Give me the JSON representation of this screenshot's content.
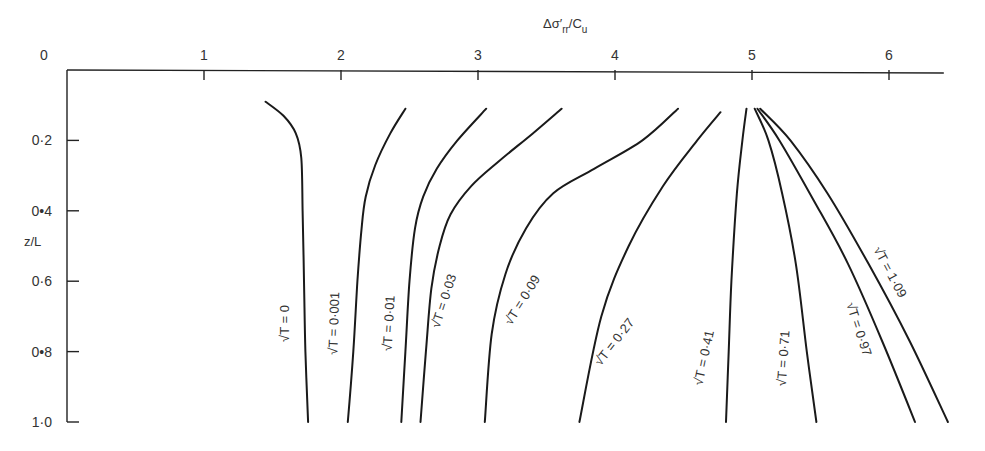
{
  "chart_data": {
    "type": "line",
    "title": "",
    "xlabel": "Δσ'rr/Cu",
    "xlabel_parts": {
      "main": "Δσ′",
      "sub1": "rr",
      "slash": "/C",
      "sub2": "u"
    },
    "ylabel": "z/L",
    "x_axis_position": "top",
    "y_axis_inverted": true,
    "xlim": [
      0,
      6.4
    ],
    "ylim": [
      0,
      1.0
    ],
    "grid": false,
    "legend": "inline labels along curves",
    "x_ticks": [
      {
        "value": 0,
        "label": "0"
      },
      {
        "value": 1,
        "label": "1"
      },
      {
        "value": 2,
        "label": "2"
      },
      {
        "value": 3,
        "label": "3"
      },
      {
        "value": 4,
        "label": "4"
      },
      {
        "value": 5,
        "label": "5"
      },
      {
        "value": 6,
        "label": "6"
      }
    ],
    "y_ticks": [
      {
        "value": 0.2,
        "label": "0·2"
      },
      {
        "value": 0.4,
        "label": "0•4"
      },
      {
        "value": 0.6,
        "label": "0·6"
      },
      {
        "value": 0.8,
        "label": "0•8"
      },
      {
        "value": 1.0,
        "label": "1·0"
      }
    ],
    "series": [
      {
        "name": "√T = 0",
        "label": "√T = 0",
        "points": [
          [
            1.45,
            0.09
          ],
          [
            1.58,
            0.13
          ],
          [
            1.67,
            0.18
          ],
          [
            1.71,
            0.25
          ],
          [
            1.72,
            0.4
          ],
          [
            1.73,
            0.6
          ],
          [
            1.74,
            0.8
          ],
          [
            1.76,
            1.0
          ]
        ],
        "label_pos": [
          1.62,
          0.72
        ],
        "label_angle": -90
      },
      {
        "name": "√T = 0·001",
        "label": "√T = 0·001",
        "points": [
          [
            2.47,
            0.11
          ],
          [
            2.36,
            0.18
          ],
          [
            2.25,
            0.27
          ],
          [
            2.18,
            0.36
          ],
          [
            2.15,
            0.45
          ],
          [
            2.12,
            0.6
          ],
          [
            2.09,
            0.8
          ],
          [
            2.05,
            1.0
          ]
        ],
        "label_pos": [
          1.98,
          0.72
        ],
        "label_angle": -88
      },
      {
        "name": "√T = 0·01",
        "label": "√T = 0·01",
        "points": [
          [
            3.06,
            0.11
          ],
          [
            2.85,
            0.2
          ],
          [
            2.7,
            0.28
          ],
          [
            2.6,
            0.36
          ],
          [
            2.54,
            0.45
          ],
          [
            2.5,
            0.6
          ],
          [
            2.47,
            0.8
          ],
          [
            2.44,
            1.0
          ]
        ],
        "label_pos": [
          2.38,
          0.72
        ],
        "label_angle": -87
      },
      {
        "name": "√T = 0·03",
        "label": "√T = 0·03",
        "points": [
          [
            3.61,
            0.11
          ],
          [
            3.4,
            0.18
          ],
          [
            3.15,
            0.26
          ],
          [
            2.95,
            0.33
          ],
          [
            2.8,
            0.41
          ],
          [
            2.72,
            0.5
          ],
          [
            2.66,
            0.62
          ],
          [
            2.62,
            0.8
          ],
          [
            2.58,
            1.0
          ]
        ],
        "label_pos": [
          2.78,
          0.66
        ],
        "label_angle": -72
      },
      {
        "name": "√T = 0·09",
        "label": "√T = 0·09",
        "points": [
          [
            4.46,
            0.11
          ],
          [
            4.2,
            0.2
          ],
          [
            3.85,
            0.28
          ],
          [
            3.55,
            0.35
          ],
          [
            3.35,
            0.45
          ],
          [
            3.2,
            0.58
          ],
          [
            3.1,
            0.75
          ],
          [
            3.05,
            1.0
          ]
        ],
        "label_pos": [
          3.35,
          0.66
        ],
        "label_angle": -58
      },
      {
        "name": "√T = 0·27",
        "label": "√T = 0·27",
        "points": [
          [
            4.77,
            0.12
          ],
          [
            4.6,
            0.2
          ],
          [
            4.35,
            0.33
          ],
          [
            4.1,
            0.5
          ],
          [
            3.9,
            0.7
          ],
          [
            3.74,
            1.0
          ]
        ],
        "label_pos": [
          4.02,
          0.78
        ],
        "label_angle": -52
      },
      {
        "name": "√T = 0·41",
        "label": "√T = 0·41",
        "points": [
          [
            4.96,
            0.11
          ],
          [
            4.93,
            0.2
          ],
          [
            4.89,
            0.35
          ],
          [
            4.85,
            0.6
          ],
          [
            4.83,
            0.8
          ],
          [
            4.81,
            1.0
          ]
        ],
        "label_pos": [
          4.68,
          0.82
        ],
        "label_angle": -78
      },
      {
        "name": "√T = 0·71",
        "label": "√T = 0·71",
        "points": [
          [
            5.02,
            0.11
          ],
          [
            5.12,
            0.2
          ],
          [
            5.22,
            0.35
          ],
          [
            5.32,
            0.55
          ],
          [
            5.4,
            0.8
          ],
          [
            5.47,
            1.0
          ]
        ],
        "label_pos": [
          5.26,
          0.82
        ],
        "label_angle": -86
      },
      {
        "name": "√T = 0·97",
        "label": "√T = 0·97",
        "points": [
          [
            5.04,
            0.11
          ],
          [
            5.2,
            0.2
          ],
          [
            5.45,
            0.37
          ],
          [
            5.7,
            0.55
          ],
          [
            5.95,
            0.77
          ],
          [
            6.19,
            1.0
          ]
        ],
        "label_pos": [
          5.75,
          0.74
        ],
        "label_angle": 72
      },
      {
        "name": "√T = 1·09",
        "label": "√T = 1·09",
        "points": [
          [
            5.06,
            0.11
          ],
          [
            5.28,
            0.2
          ],
          [
            5.55,
            0.35
          ],
          [
            5.85,
            0.55
          ],
          [
            6.15,
            0.77
          ],
          [
            6.43,
            1.0
          ]
        ],
        "label_pos": [
          5.98,
          0.58
        ],
        "label_angle": 62
      }
    ]
  }
}
